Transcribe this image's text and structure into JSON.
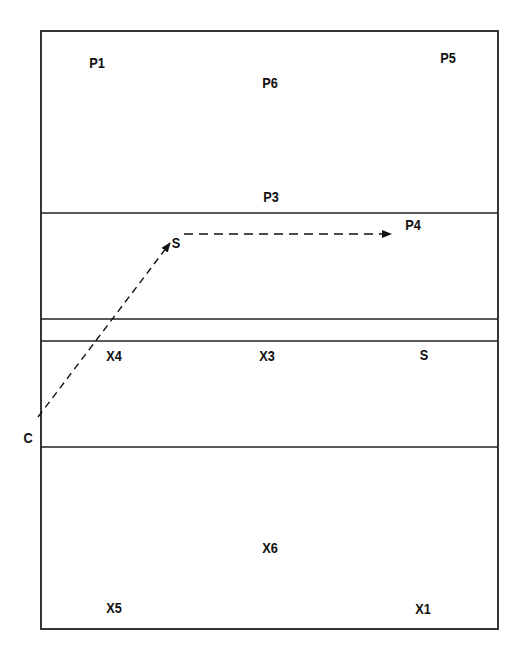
{
  "diagram": {
    "type": "volleyball-court-rotation",
    "colors": {
      "line": "#222222",
      "background": "#ffffff",
      "text": "#111111"
    },
    "court": {
      "left": 41,
      "top": 31,
      "right": 498,
      "bottom": 629
    },
    "horizontal_lines_y": [
      213,
      319,
      341,
      447
    ],
    "labels": {
      "p1": "P1",
      "p5": "P5",
      "p6": "P6",
      "p3": "P3",
      "p4": "P4",
      "s_top": "S",
      "x4": "X4",
      "x3": "X3",
      "s_bottom": "S",
      "c": "C",
      "x6": "X6",
      "x5": "X5",
      "x1": "X1"
    },
    "arrows": [
      {
        "name": "c-to-s",
        "from": [
          38,
          417
        ],
        "to": [
          170,
          243
        ],
        "style": "dashed"
      },
      {
        "name": "s-to-p4",
        "from": [
          184,
          234
        ],
        "to": [
          391,
          234
        ],
        "style": "dashed"
      }
    ]
  }
}
